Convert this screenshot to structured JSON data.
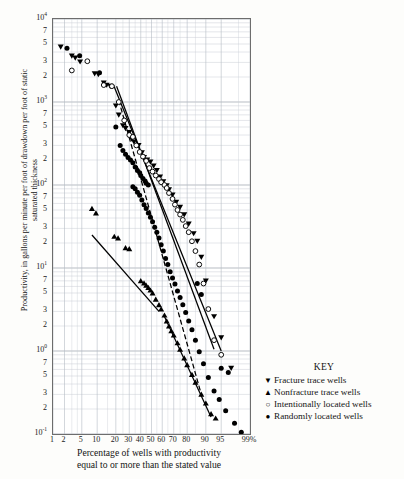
{
  "chart_data": {
    "type": "scatter",
    "title": "",
    "xlabel": "Percentage of wells with productivity equal to or more than the stated value",
    "ylabel": "Productivity, in gallons per minute per foot of drawdown per foot of static saturated thickness",
    "x_scale": "probability",
    "y_scale": "log",
    "ylim": [
      0.1,
      10000
    ],
    "xlim": [
      1,
      99
    ],
    "grid": true,
    "legend_position": "right-bottom",
    "x_ticks": [
      {
        "value": 1,
        "label": "1"
      },
      {
        "value": 2,
        "label": "2"
      },
      {
        "value": 5,
        "label": "5"
      },
      {
        "value": 10,
        "label": "10"
      },
      {
        "value": 20,
        "label": "20"
      },
      {
        "value": 30,
        "label": "30"
      },
      {
        "value": 40,
        "label": "40"
      },
      {
        "value": 50,
        "label": "50"
      },
      {
        "value": 60,
        "label": "60"
      },
      {
        "value": 70,
        "label": "70"
      },
      {
        "value": 80,
        "label": "80"
      },
      {
        "value": 90,
        "label": "90"
      },
      {
        "value": 95,
        "label": "95"
      },
      {
        "value": 99,
        "label": "99%"
      }
    ],
    "y_ticks": [
      {
        "value": 10000,
        "label": "10",
        "exp": "4"
      },
      {
        "value": 7000,
        "label": "7",
        "exp": ""
      },
      {
        "value": 5000,
        "label": "5",
        "exp": ""
      },
      {
        "value": 3000,
        "label": "3",
        "exp": ""
      },
      {
        "value": 2000,
        "label": "2",
        "exp": ""
      },
      {
        "value": 1000,
        "label": "10",
        "exp": "3"
      },
      {
        "value": 700,
        "label": "7",
        "exp": ""
      },
      {
        "value": 500,
        "label": "5",
        "exp": ""
      },
      {
        "value": 300,
        "label": "3",
        "exp": ""
      },
      {
        "value": 200,
        "label": "2",
        "exp": ""
      },
      {
        "value": 100,
        "label": "10",
        "exp": "2"
      },
      {
        "value": 70,
        "label": "7",
        "exp": ""
      },
      {
        "value": 50,
        "label": "5",
        "exp": ""
      },
      {
        "value": 30,
        "label": "3",
        "exp": ""
      },
      {
        "value": 20,
        "label": "2",
        "exp": ""
      },
      {
        "value": 10,
        "label": "10",
        "exp": "1"
      },
      {
        "value": 7,
        "label": "7",
        "exp": ""
      },
      {
        "value": 5,
        "label": "5",
        "exp": ""
      },
      {
        "value": 3,
        "label": "3",
        "exp": ""
      },
      {
        "value": 2,
        "label": "2",
        "exp": ""
      },
      {
        "value": 1,
        "label": "10",
        "exp": "0"
      },
      {
        "value": 0.7,
        "label": "7",
        "exp": ""
      },
      {
        "value": 0.5,
        "label": "5",
        "exp": ""
      },
      {
        "value": 0.3,
        "label": "3",
        "exp": ""
      },
      {
        "value": 0.2,
        "label": "2",
        "exp": ""
      },
      {
        "value": 0.1,
        "label": "10",
        "exp": "-1"
      }
    ],
    "series": [
      {
        "name": "Fracture trace wells",
        "marker": "triangle-down",
        "color": "#000000",
        "points": [
          [
            1.6,
            4600
          ],
          [
            3.0,
            3600
          ],
          [
            3.6,
            3400
          ],
          [
            4.6,
            3050
          ],
          [
            9.0,
            2200
          ],
          [
            10.5,
            2150
          ],
          [
            13.0,
            1700
          ],
          [
            14.5,
            1600
          ],
          [
            16.5,
            1550
          ],
          [
            20.0,
            900
          ],
          [
            22.0,
            700
          ],
          [
            25.0,
            520
          ],
          [
            27.0,
            480
          ],
          [
            30.0,
            430
          ],
          [
            32.0,
            360
          ],
          [
            34.0,
            330
          ],
          [
            38.0,
            300
          ],
          [
            41.0,
            245
          ],
          [
            43.0,
            215
          ],
          [
            46.0,
            200
          ],
          [
            49.0,
            190
          ],
          [
            52.0,
            170
          ],
          [
            55.0,
            150
          ],
          [
            58.0,
            125
          ],
          [
            61.0,
            110
          ],
          [
            64.0,
            98
          ],
          [
            66.0,
            88
          ],
          [
            69.0,
            76
          ],
          [
            72.0,
            62
          ],
          [
            75.0,
            54
          ],
          [
            78.0,
            44
          ],
          [
            81.0,
            34
          ],
          [
            84.0,
            26
          ],
          [
            86.0,
            21
          ],
          [
            88.0,
            13.5
          ],
          [
            90.0,
            7.0
          ],
          [
            93.0,
            2.6
          ],
          [
            95.0,
            1.45
          ],
          [
            97.0,
            0.62
          ]
        ]
      },
      {
        "name": "Nonfracture trace wells",
        "marker": "triangle-up",
        "color": "#000000",
        "points": [
          [
            8.0,
            52
          ],
          [
            9.5,
            46
          ],
          [
            19.0,
            24
          ],
          [
            21.5,
            23
          ],
          [
            27.0,
            17.5
          ],
          [
            30.0,
            17.0
          ],
          [
            40.0,
            7.0
          ],
          [
            43.0,
            6.6
          ],
          [
            45.0,
            6.2
          ],
          [
            47.0,
            5.8
          ],
          [
            49.0,
            5.4
          ],
          [
            51.0,
            5.0
          ],
          [
            54.0,
            4.2
          ],
          [
            57.0,
            3.6
          ],
          [
            59.0,
            3.2
          ],
          [
            62.0,
            2.7
          ],
          [
            64.0,
            2.3
          ],
          [
            66.0,
            2.0
          ],
          [
            68.0,
            1.75
          ],
          [
            70.0,
            1.55
          ],
          [
            73.0,
            1.25
          ],
          [
            75.0,
            1.05
          ],
          [
            78.0,
            0.82
          ],
          [
            80.0,
            0.68
          ],
          [
            83.0,
            0.52
          ],
          [
            85.0,
            0.42
          ],
          [
            88.0,
            0.3
          ],
          [
            90.0,
            0.235
          ],
          [
            92.0,
            0.175
          ],
          [
            93.5,
            0.155
          ]
        ]
      },
      {
        "name": "Intentionally located wells",
        "marker": "circle-open",
        "color": "#000000",
        "points": [
          [
            3.0,
            2400
          ],
          [
            6.5,
            3100
          ],
          [
            13.0,
            1600
          ],
          [
            17.5,
            1550
          ],
          [
            22.0,
            1000
          ],
          [
            26.0,
            600
          ],
          [
            30.0,
            400
          ],
          [
            33.0,
            380
          ],
          [
            36.0,
            300
          ],
          [
            39.0,
            250
          ],
          [
            42.0,
            220
          ],
          [
            45.0,
            195
          ],
          [
            48.0,
            160
          ],
          [
            51.0,
            145
          ],
          [
            54.0,
            130
          ],
          [
            57.0,
            118
          ],
          [
            59.0,
            108
          ],
          [
            62.0,
            100
          ],
          [
            64.0,
            92
          ],
          [
            66.0,
            80
          ],
          [
            69.0,
            68
          ],
          [
            71.0,
            58
          ],
          [
            73.0,
            50
          ],
          [
            75.0,
            44
          ],
          [
            77.0,
            38
          ],
          [
            79.0,
            32
          ],
          [
            81.0,
            27
          ],
          [
            83.0,
            21
          ],
          [
            85.0,
            16
          ],
          [
            87.0,
            11
          ],
          [
            89.0,
            6.5
          ],
          [
            91.0,
            3.2
          ],
          [
            93.0,
            1.35
          ],
          [
            95.0,
            0.9
          ]
        ]
      },
      {
        "name": "Randomly located wells",
        "marker": "circle-filled",
        "color": "#000000",
        "points": [
          [
            2.3,
            4450
          ],
          [
            4.5,
            3600
          ],
          [
            11.0,
            2250
          ],
          [
            20.0,
            500
          ],
          [
            23.0,
            300
          ],
          [
            25.0,
            260
          ],
          [
            27.0,
            235
          ],
          [
            29.0,
            215
          ],
          [
            31.0,
            200
          ],
          [
            33.0,
            185
          ],
          [
            35.0,
            165
          ],
          [
            37.0,
            150
          ],
          [
            39.0,
            140
          ],
          [
            40.0,
            130
          ],
          [
            42.0,
            120
          ],
          [
            44.0,
            112
          ],
          [
            45.0,
            105
          ],
          [
            47.0,
            100
          ],
          [
            33.0,
            95
          ],
          [
            35.0,
            90
          ],
          [
            37.0,
            82
          ],
          [
            39.0,
            75
          ],
          [
            41.0,
            66
          ],
          [
            43.0,
            58
          ],
          [
            45.0,
            52
          ],
          [
            47.0,
            46
          ],
          [
            49.0,
            41
          ],
          [
            51.0,
            36
          ],
          [
            53.0,
            31
          ],
          [
            55.0,
            27
          ],
          [
            57.0,
            23
          ],
          [
            59.0,
            19
          ],
          [
            61.0,
            16
          ],
          [
            63.0,
            13
          ],
          [
            65.0,
            11
          ],
          [
            67.0,
            9.0
          ],
          [
            69.0,
            7.6
          ],
          [
            71.0,
            6.4
          ],
          [
            73.0,
            5.3
          ],
          [
            75.0,
            4.4
          ],
          [
            77.0,
            3.6
          ],
          [
            79.0,
            2.9
          ],
          [
            81.0,
            2.3
          ],
          [
            83.0,
            1.8
          ],
          [
            85.0,
            1.35
          ],
          [
            87.0,
            0.98
          ],
          [
            89.0,
            0.7
          ],
          [
            91.0,
            0.48
          ],
          [
            93.0,
            0.33
          ],
          [
            94.5,
            0.26
          ],
          [
            96.0,
            0.19
          ],
          [
            97.5,
            0.135
          ],
          [
            98.3,
            0.105
          ],
          [
            86.0,
            6.5
          ],
          [
            88.0,
            4.8
          ],
          [
            95.0,
            0.62
          ],
          [
            96.5,
            0.55
          ]
        ]
      }
    ],
    "trend_lines": [
      {
        "name": "fracture-trend",
        "style": "solid",
        "points": [
          [
            18.5,
            1600
          ],
          [
            95.0,
            1.0
          ]
        ]
      },
      {
        "name": "intentional-trend",
        "style": "solid",
        "points": [
          [
            20.5,
            1550
          ],
          [
            93.0,
            1.05
          ]
        ]
      },
      {
        "name": "random-trend",
        "style": "dashed",
        "points": [
          [
            22.0,
            1050
          ],
          [
            88.0,
            0.3
          ]
        ]
      },
      {
        "name": "nonfracture-trend",
        "style": "solid",
        "points": [
          [
            8.0,
            25
          ],
          [
            57.0,
            3.0
          ]
        ]
      },
      {
        "name": "nonfracture-lower-trend",
        "style": "solid",
        "points": [
          [
            62.0,
            2.6
          ],
          [
            92.0,
            0.16
          ]
        ]
      }
    ]
  },
  "legend": {
    "title": "KEY",
    "items": [
      {
        "symbol": "▼",
        "label": "Fracture trace wells",
        "icon": "triangle-down-icon"
      },
      {
        "symbol": "▲",
        "label": "Nonfracture trace wells",
        "icon": "triangle-up-icon"
      },
      {
        "symbol": "○",
        "label": "Intentionally located wells",
        "icon": "circle-open-icon"
      },
      {
        "symbol": "●",
        "label": "Randomly located wells",
        "icon": "circle-filled-icon"
      }
    ]
  },
  "axis_titles": {
    "y": "Productivity, in gallons per minute per foot of drawdown per foot of static saturated thickness",
    "x_line1": "Percentage of wells with productivity",
    "x_line2": "equal to or more than the stated value"
  },
  "colors": {
    "ink": "#000000",
    "grid": "#c8cdd4",
    "frame": "#6d6d6d",
    "background": "#ffffff"
  }
}
